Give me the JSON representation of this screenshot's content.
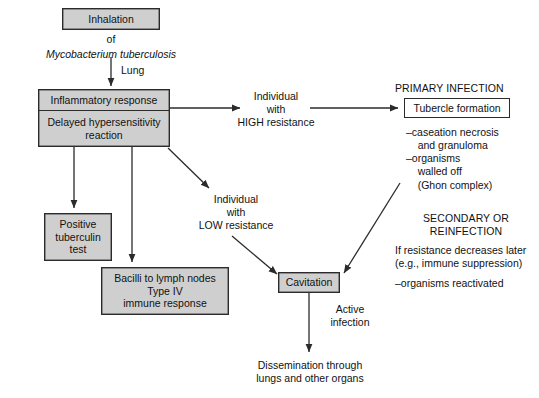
{
  "diagram": {
    "accent_fill": "#cfcfcf",
    "stroke": "#2b2b2b",
    "background": "#ffffff"
  },
  "nodes": {
    "inhalation": {
      "label": "Inhalation"
    },
    "inflammatory": {
      "line1": "Inflammatory response",
      "line2": "Delayed hypersensitivity\nreaction"
    },
    "tuberculin": {
      "label": "Positive\ntuberculin\ntest"
    },
    "bacilli": {
      "label": "Bacilli to lymph nodes\nType IV\nimmune response"
    },
    "tubercle": {
      "label": "Tubercle formation"
    },
    "cavitation": {
      "label": "Cavitation"
    }
  },
  "labels": {
    "of": "of",
    "organism": "Mycobacterium tuberculosis",
    "lung": "Lung",
    "high_resistance": "Individual\nwith\nHIGH resistance",
    "low_resistance": "Individual\nwith\nLOW resistance",
    "active_infection": "Active\ninfection",
    "dissemination": "Dissemination through\nlungs and other organs"
  },
  "sections": {
    "primary": {
      "heading": "PRIMARY INFECTION",
      "details": "–caseation necrosis\n    and granuloma\n–organisms\n    walled off\n    (Ghon complex)"
    },
    "secondary": {
      "heading": "SECONDARY OR\nREINFECTION",
      "condition": "If resistance decreases later\n(e.g., immune suppression)",
      "detail": "–organisms reactivated"
    }
  }
}
